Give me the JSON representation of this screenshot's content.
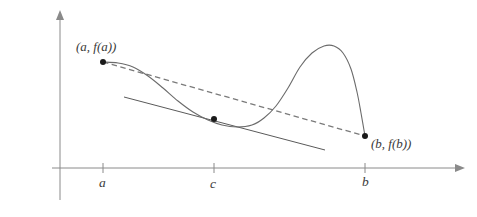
{
  "figure": {
    "background_color": "#ffffff",
    "curve_color": "#6b6b6b",
    "axis_color": "#8a8a8a",
    "secant_color": "#7a7a7a",
    "tangent_color": "#5a5a5a",
    "point_color": "#1a1a1a",
    "label_color": "#3a3a3a"
  },
  "labels": {
    "point_a": "(a, f(a))",
    "point_b": "(b, f(b))",
    "tick_a": "a",
    "tick_c": "c",
    "tick_b": "b"
  },
  "chart_data": {
    "type": "line",
    "title": "",
    "xlabel": "",
    "ylabel": "",
    "grid": false,
    "legend": null,
    "axes": {
      "x_axis_y_px": 168,
      "y_axis_x_px": 60,
      "x_axis_from_px": 52,
      "x_axis_to_px": 465,
      "y_axis_top_px": 10,
      "y_axis_bottom_px": 200,
      "x_arrow": true,
      "y_arrow": true
    },
    "tick_marks": [
      {
        "label": "a",
        "x_px": 103
      },
      {
        "label": "c",
        "x_px": 214
      },
      {
        "label": "b",
        "x_px": 365
      }
    ],
    "marked_points": [
      {
        "name": "(a, f(a))",
        "x_px": 103,
        "y_px": 62
      },
      {
        "name": "c",
        "x_px": 214,
        "y_px": 119
      },
      {
        "name": "(b, f(b))",
        "x_px": 365,
        "y_px": 136
      }
    ],
    "curve_points_px": [
      [
        103,
        62
      ],
      [
        118,
        63
      ],
      [
        133,
        67
      ],
      [
        148,
        76
      ],
      [
        163,
        88
      ],
      [
        178,
        101
      ],
      [
        193,
        112
      ],
      [
        208,
        120
      ],
      [
        222,
        125
      ],
      [
        237,
        127
      ],
      [
        252,
        125
      ],
      [
        264,
        118
      ],
      [
        276,
        106
      ],
      [
        288,
        88
      ],
      [
        300,
        67
      ],
      [
        312,
        53
      ],
      [
        324,
        46
      ],
      [
        334,
        46
      ],
      [
        343,
        53
      ],
      [
        351,
        69
      ],
      [
        357,
        92
      ],
      [
        361,
        113
      ],
      [
        365,
        136
      ]
    ],
    "secant_line_px": {
      "x1": 103,
      "y1": 62,
      "x2": 365,
      "y2": 136,
      "style": "dashed"
    },
    "tangent_line_px": {
      "x1": 124,
      "y1": 97,
      "x2": 325,
      "y2": 150,
      "style": "solid"
    }
  }
}
